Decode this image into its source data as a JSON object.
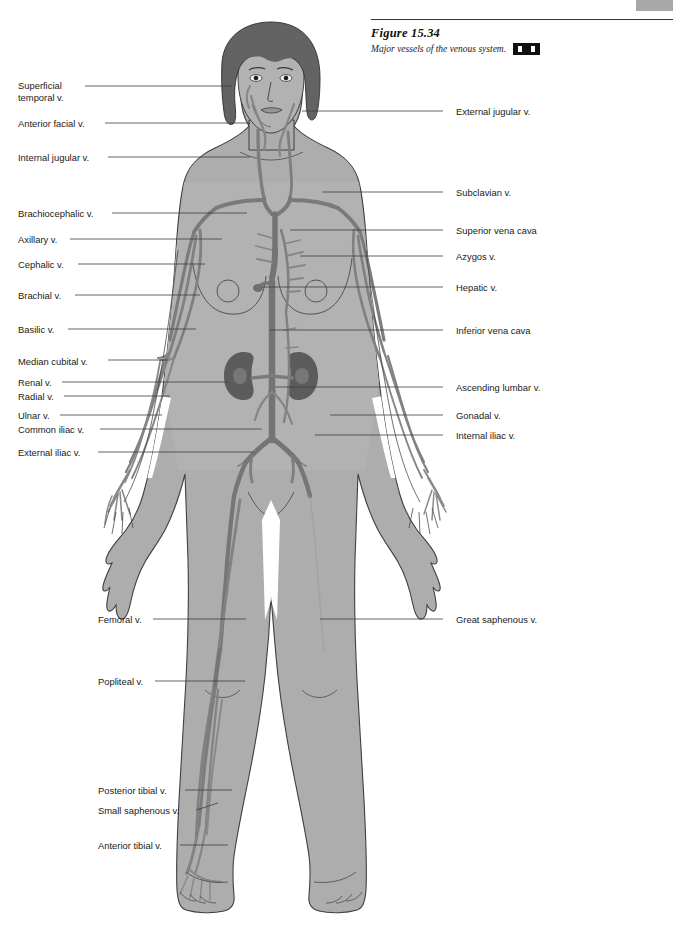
{
  "page": {
    "running_head": "",
    "corner_tab_color": "#a8a8a8"
  },
  "figure": {
    "number_label": "Figure 15.34",
    "caption": "Major vessels of the venous system.",
    "media_icon": "media-cd-icon"
  },
  "colors": {
    "body_fill": "#a9a9a9",
    "body_fill_light": "#b4b4b4",
    "hair": "#6e6e6e",
    "vein": "#8a8a8a",
    "vein_dark": "#707070",
    "organ": "#5f5f5f",
    "outline": "#3a3a3a",
    "leader_line": "#4a4a4a",
    "text": "#1a1a1a"
  },
  "labels": {
    "left": [
      {
        "id": "superficial-temporal-v",
        "text": "Superficial\ntemporal v.",
        "x": 18,
        "y": 80,
        "line_x1": 85,
        "line_y1": 86,
        "line_x2": 232,
        "line_y2": 86
      },
      {
        "id": "anterior-facial-v",
        "text": "Anterior facial v.",
        "x": 18,
        "y": 118,
        "line_x1": 105,
        "line_y1": 123,
        "line_x2": 250,
        "line_y2": 123
      },
      {
        "id": "internal-jugular-v",
        "text": "Internal jugular v.",
        "x": 18,
        "y": 152,
        "line_x1": 108,
        "line_y1": 157,
        "line_x2": 250,
        "line_y2": 157
      },
      {
        "id": "brachiocephalic-v",
        "text": "Brachiocephalic v.",
        "x": 18,
        "y": 208,
        "line_x1": 112,
        "line_y1": 213,
        "line_x2": 247,
        "line_y2": 213
      },
      {
        "id": "axillary-v",
        "text": "Axillary v.",
        "x": 18,
        "y": 234,
        "line_x1": 70,
        "line_y1": 239,
        "line_x2": 222,
        "line_y2": 239
      },
      {
        "id": "cephalic-v",
        "text": "Cephalic v.",
        "x": 18,
        "y": 259,
        "line_x1": 78,
        "line_y1": 264,
        "line_x2": 205,
        "line_y2": 264
      },
      {
        "id": "brachial-v",
        "text": "Brachial v.",
        "x": 18,
        "y": 290,
        "line_x1": 75,
        "line_y1": 295,
        "line_x2": 200,
        "line_y2": 295
      },
      {
        "id": "basilic-v",
        "text": "Basilic v.",
        "x": 18,
        "y": 324,
        "line_x1": 68,
        "line_y1": 329,
        "line_x2": 196,
        "line_y2": 329
      },
      {
        "id": "median-cubital-v",
        "text": "Median cubital v.",
        "x": 18,
        "y": 356,
        "line_x1": 108,
        "line_y1": 360,
        "line_x2": 168,
        "line_y2": 360
      },
      {
        "id": "renal-v",
        "text": "Renal v.",
        "x": 18,
        "y": 377,
        "line_x1": 62,
        "line_y1": 382,
        "line_x2": 228,
        "line_y2": 382
      },
      {
        "id": "radial-v",
        "text": "Radial v.",
        "x": 18,
        "y": 391,
        "line_x1": 64,
        "line_y1": 396,
        "line_x2": 170,
        "line_y2": 396
      },
      {
        "id": "ulnar-v",
        "text": "Ulnar v.",
        "x": 18,
        "y": 410,
        "line_x1": 60,
        "line_y1": 415,
        "line_x2": 162,
        "line_y2": 415
      },
      {
        "id": "common-iliac-v",
        "text": "Common iliac v.",
        "x": 18,
        "y": 424,
        "line_x1": 100,
        "line_y1": 429,
        "line_x2": 262,
        "line_y2": 429
      },
      {
        "id": "external-iliac-v",
        "text": "External iliac v.",
        "x": 18,
        "y": 447,
        "line_x1": 98,
        "line_y1": 452,
        "line_x2": 253,
        "line_y2": 452
      },
      {
        "id": "femoral-v",
        "text": "Femoral v.",
        "x": 98,
        "y": 614,
        "line_x1": 153,
        "line_y1": 619,
        "line_x2": 246,
        "line_y2": 619
      },
      {
        "id": "popliteal-v",
        "text": "Popliteal v.",
        "x": 98,
        "y": 676,
        "line_x1": 155,
        "line_y1": 681,
        "line_x2": 245,
        "line_y2": 681
      },
      {
        "id": "posterior-tibial-v",
        "text": "Posterior tibial v.",
        "x": 98,
        "y": 785,
        "line_x1": 185,
        "line_y1": 790,
        "line_x2": 232,
        "line_y2": 790
      },
      {
        "id": "small-saphenous-v",
        "text": "Small saphenous v.",
        "x": 98,
        "y": 805,
        "line_x1": 196,
        "line_y1": 810,
        "line_x2": 218,
        "line_y2": 803
      },
      {
        "id": "anterior-tibial-v",
        "text": "Anterior tibial v.",
        "x": 98,
        "y": 840,
        "line_x1": 180,
        "line_y1": 845,
        "line_x2": 228,
        "line_y2": 845
      }
    ],
    "right": [
      {
        "id": "external-jugular-v",
        "text": "External jugular v.",
        "x": 456,
        "y": 106,
        "line_x1": 443,
        "line_y1": 111,
        "line_x2": 302,
        "line_y2": 111
      },
      {
        "id": "subclavian-v",
        "text": "Subclavian v.",
        "x": 456,
        "y": 187,
        "line_x1": 443,
        "line_y1": 192,
        "line_x2": 322,
        "line_y2": 192
      },
      {
        "id": "superior-vena-cava",
        "text": "Superior vena cava",
        "x": 456,
        "y": 225,
        "line_x1": 443,
        "line_y1": 230,
        "line_x2": 290,
        "line_y2": 230
      },
      {
        "id": "azygos-v",
        "text": "Azygos v.",
        "x": 456,
        "y": 251,
        "line_x1": 443,
        "line_y1": 256,
        "line_x2": 300,
        "line_y2": 256
      },
      {
        "id": "hepatic-v",
        "text": "Hepatic v.",
        "x": 456,
        "y": 282,
        "line_x1": 443,
        "line_y1": 287,
        "line_x2": 262,
        "line_y2": 287
      },
      {
        "id": "inferior-vena-cava",
        "text": "Inferior vena cava",
        "x": 456,
        "y": 325,
        "line_x1": 443,
        "line_y1": 330,
        "line_x2": 270,
        "line_y2": 330
      },
      {
        "id": "ascending-lumbar-v",
        "text": "Ascending lumbar v.",
        "x": 456,
        "y": 382,
        "line_x1": 443,
        "line_y1": 387,
        "line_x2": 275,
        "line_y2": 387
      },
      {
        "id": "gonadal-v",
        "text": "Gonadal v.",
        "x": 456,
        "y": 410,
        "line_x1": 443,
        "line_y1": 415,
        "line_x2": 330,
        "line_y2": 415
      },
      {
        "id": "internal-iliac-v",
        "text": "Internal iliac v.",
        "x": 456,
        "y": 430,
        "line_x1": 443,
        "line_y1": 435,
        "line_x2": 315,
        "line_y2": 435
      },
      {
        "id": "great-saphenous-v",
        "text": "Great saphenous v.",
        "x": 456,
        "y": 614,
        "line_x1": 443,
        "line_y1": 619,
        "line_x2": 320,
        "line_y2": 619
      }
    ]
  }
}
